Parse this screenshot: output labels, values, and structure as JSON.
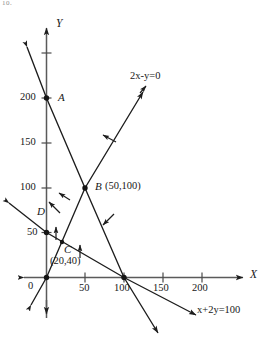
{
  "figure": {
    "corner_mark": "10.",
    "axes": {
      "x_name": "X",
      "y_name": "Y",
      "origin_label": "0",
      "x_ticks": [
        {
          "value": 50,
          "label": "50"
        },
        {
          "value": 100,
          "label": "100"
        },
        {
          "value": 150,
          "label": "150"
        },
        {
          "value": 200,
          "label": "200"
        }
      ],
      "y_ticks": [
        {
          "value": 50,
          "label": "50"
        },
        {
          "value": 100,
          "label": "100"
        },
        {
          "value": 150,
          "label": "150"
        },
        {
          "value": 200,
          "label": "200"
        }
      ],
      "x_range": [
        -20,
        235
      ],
      "y_range": [
        -40,
        245
      ]
    },
    "lines": [
      {
        "id": "line-2x-y-0",
        "equation_label": "2x-y=0",
        "label_parts": {
          "a": "2",
          "x": "x",
          "mid": "-",
          "y": "y",
          "eq": "=0"
        },
        "through": [
          [
            0,
            0
          ],
          [
            100,
            200
          ]
        ],
        "style": "solid"
      },
      {
        "id": "line-x-2y-100",
        "equation_label": "x+2y=100",
        "label_parts": {
          "x": "x",
          "plus": "+",
          "a": "2",
          "y": "y",
          "eq": "=100"
        },
        "through": [
          [
            0,
            50
          ],
          [
            100,
            0
          ]
        ],
        "style": "solid"
      },
      {
        "id": "line-through-A-and-x-axis",
        "equation_label": "",
        "through": [
          [
            0,
            200
          ],
          [
            110,
            0
          ]
        ],
        "style": "solid"
      }
    ],
    "points": [
      {
        "name": "A",
        "label": "A",
        "coords_label": "",
        "x": 0,
        "y": 200
      },
      {
        "name": "B",
        "label": "B",
        "coords_label": "(50,100)",
        "x": 50,
        "y": 100
      },
      {
        "name": "C",
        "label": "C",
        "coords_label": "(20,40)",
        "x": 20,
        "y": 40
      },
      {
        "name": "D",
        "label": "D",
        "coords_label": "",
        "x": 0,
        "y": 50
      },
      {
        "name": "E",
        "label": "",
        "coords_label": "",
        "x": 110,
        "y": 0
      }
    ],
    "direction_arrows": [
      {
        "at": [
          28,
          62
        ],
        "toward": "up-left"
      },
      {
        "at": [
          18,
          38
        ],
        "toward": "up"
      },
      {
        "at": [
          42,
          22
        ],
        "toward": "up"
      },
      {
        "at": [
          72,
          88
        ],
        "toward": "up-left"
      },
      {
        "at": [
          78,
          40
        ],
        "toward": "up"
      },
      {
        "at": [
          96,
          72
        ],
        "toward": "down-left"
      },
      {
        "at": [
          60,
          150
        ],
        "toward": "up-left"
      }
    ],
    "colors": {
      "ink": "#171717",
      "axis": "#4a4a4a",
      "background": "#ffffff"
    }
  }
}
